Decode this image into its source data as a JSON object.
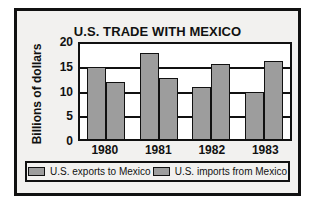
{
  "chart_data": {
    "type": "bar",
    "title": "U.S. TRADE WITH MEXICO",
    "xlabel": "",
    "ylabel": "Billions of dollars",
    "categories": [
      "1980",
      "1981",
      "1982",
      "1983"
    ],
    "series": [
      {
        "name": "U.S. exports to Mexico",
        "values": [
          15.1,
          18.2,
          11.0,
          9.8
        ]
      },
      {
        "name": "U.S. imports from Mexico",
        "values": [
          12.0,
          12.9,
          15.7,
          16.5
        ]
      }
    ],
    "ylim": [
      0,
      20
    ],
    "yticks": [
      "0",
      "5",
      "10",
      "15",
      "20"
    ],
    "ytick_values": [
      0,
      5,
      10,
      15,
      20
    ],
    "grid": true,
    "legend_position": "bottom",
    "colors": {
      "bar_fill": "#9d9d9d",
      "bar_stroke": "#111111",
      "plot_background": "#ffffff",
      "card_background": "#f2f1ef",
      "border": "#111111",
      "text": "#111111"
    }
  },
  "legend": {
    "entries": [
      {
        "label": "U.S. exports to Mexico",
        "swatch": "gray-swatch-icon"
      },
      {
        "label": "U.S. imports from Mexico",
        "swatch": "gray-swatch-icon"
      }
    ]
  }
}
